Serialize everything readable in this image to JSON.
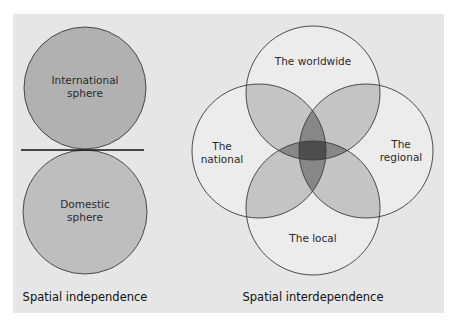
{
  "left_diagram": {
    "title": "Spatial independence",
    "circles": [
      {
        "label_line1": "International",
        "label_line2": "sphere",
        "fill": "#b1b1b1"
      },
      {
        "label_line1": "Domestic",
        "label_line2": "sphere",
        "fill": "#bebebe"
      }
    ]
  },
  "right_diagram": {
    "title": "Spatial interdependence",
    "circles": [
      {
        "label_line1": "The worldwide",
        "label_line2": ""
      },
      {
        "label_line1": "The",
        "label_line2": "national"
      },
      {
        "label_line1": "The",
        "label_line2": "regional"
      },
      {
        "label_line1": "The local",
        "label_line2": ""
      }
    ],
    "base_fill": "#ececec",
    "overlap_fill": "#000000"
  },
  "colors": {
    "panel_bg": "#e6e6e6",
    "stroke": "#3a3a3a"
  }
}
